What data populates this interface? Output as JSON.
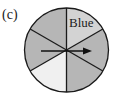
{
  "figure": {
    "label": "(c)",
    "spinner": {
      "sectors": [
        {
          "position": "top-right",
          "text": "Blue",
          "fill": "#d3d3d3"
        },
        {
          "position": "right",
          "text": "",
          "fill": "#b6b6b6"
        },
        {
          "position": "bottom-right",
          "text": "",
          "fill": "#b6b6b6"
        },
        {
          "position": "bottom-left",
          "text": "",
          "fill": "#f0f0f0"
        },
        {
          "position": "left",
          "text": "",
          "fill": "#b6b6b6"
        },
        {
          "position": "top-left",
          "text": "",
          "fill": "#b6b6b6"
        }
      ],
      "arrow": "pointer-arrow"
    }
  }
}
